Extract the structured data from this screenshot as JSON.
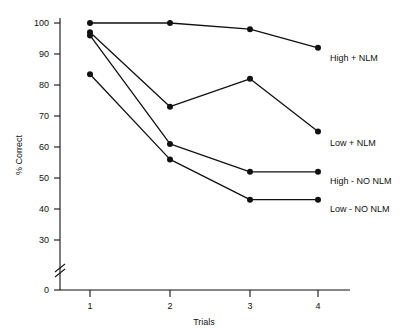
{
  "chart_data": {
    "type": "line",
    "title": "",
    "xlabel": "Trials",
    "ylabel": "% Correct",
    "x": [
      1,
      2,
      3,
      4
    ],
    "xtick_labels": [
      "1",
      "2",
      "3",
      "4"
    ],
    "ytick_labels": [
      "0",
      "30",
      "40",
      "50",
      "60",
      "70",
      "80",
      "90",
      "100"
    ],
    "ytick_values": [
      0,
      30,
      40,
      50,
      60,
      70,
      80,
      90,
      100
    ],
    "ylim": [
      0,
      100
    ],
    "axis_break": true,
    "axis_break_between": [
      0,
      30
    ],
    "grid": false,
    "legend_position": "right-inline",
    "marker": "filled-circle",
    "line_color": "#111111",
    "series": [
      {
        "name": "High + NLM",
        "values": [
          100.0,
          100.0,
          98.0,
          92.0
        ]
      },
      {
        "name": "Low + NLM",
        "values": [
          97.0,
          73.0,
          82.0,
          65.0
        ]
      },
      {
        "name": "High - NO NLM",
        "values": [
          96.0,
          61.0,
          52.0,
          52.0
        ]
      },
      {
        "name": "Low - NO NLM",
        "values": [
          83.5,
          56.0,
          43.0,
          43.0
        ]
      }
    ]
  },
  "labels": {
    "s0": "High + NLM",
    "s1": "Low + NLM",
    "s2": "High - NO NLM",
    "s3": "Low - NO NLM",
    "xlabel": "Trials",
    "ylabel": "% Correct",
    "y_100": "100",
    "y_90": "90",
    "y_80": "80",
    "y_70": "70",
    "y_60": "60",
    "y_50": "50",
    "y_40": "40",
    "y_30": "30",
    "y_0": "0",
    "x_1": "1",
    "x_2": "2",
    "x_3": "3",
    "x_4": "4"
  }
}
